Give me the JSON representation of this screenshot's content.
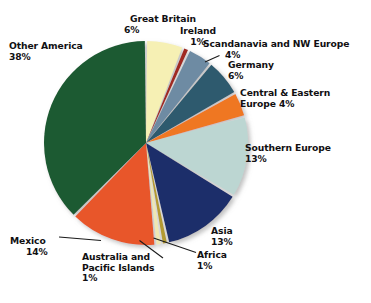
{
  "chart_data": {
    "type": "pie",
    "title": "",
    "subtitle": "",
    "xlabel": "",
    "ylabel": "",
    "legend_position": "none",
    "grid": false,
    "units": "percent",
    "start_angle_deg": 0,
    "direction": "clockwise",
    "background_color": "#ffffff",
    "label_color": "#111012",
    "categories": [
      "Great Britain",
      "Ireland",
      "Scandanavia and NW Europe",
      "Germany",
      "Central & Eastern Europe",
      "Southern Europe",
      "Asia",
      "Africa",
      "Australia and Pacific Islands",
      "Mexico",
      "Other America"
    ],
    "values": [
      6,
      1,
      4,
      6,
      4,
      13,
      13,
      1,
      1,
      14,
      38
    ],
    "colors": [
      "#f6f0b4",
      "#a02a22",
      "#6e8ba3",
      "#2d5a6e",
      "#ef7723",
      "#bcd6d2",
      "#1b2d6b",
      "#b39a33",
      "#efe7b2",
      "#e8562a",
      "#1a5a31"
    ],
    "slices": [
      {
        "name": "Great Britain",
        "value": 6,
        "value_text": "6%",
        "label_lines": [
          "Great Britain",
          "6%"
        ],
        "color": "#f6f0b4",
        "leader_line": false
      },
      {
        "name": "Ireland",
        "value": 1,
        "value_text": "1%",
        "label_lines": [
          "Ireland",
          "1%"
        ],
        "color": "#a02a22",
        "leader_line": false
      },
      {
        "name": "Scandanavia and NW Europe",
        "value": 4,
        "value_text": "4%",
        "label_lines": [
          "Scandanavia and NW Europe",
          "4%"
        ],
        "color": "#6e8ba3",
        "leader_line": true
      },
      {
        "name": "Germany",
        "value": 6,
        "value_text": "6%",
        "label_lines": [
          "Germany",
          "6%"
        ],
        "color": "#2d5a6e",
        "leader_line": false
      },
      {
        "name": "Central & Eastern Europe",
        "value": 4,
        "value_text": "4%",
        "label_lines": [
          "Central & Eastern",
          "Europe  4%"
        ],
        "color": "#ef7723",
        "leader_line": false
      },
      {
        "name": "Southern Europe",
        "value": 13,
        "value_text": "13%",
        "label_lines": [
          "Southern Europe",
          "13%"
        ],
        "color": "#bcd6d2",
        "leader_line": false
      },
      {
        "name": "Asia",
        "value": 13,
        "value_text": "13%",
        "label_lines": [
          "Asia",
          "13%"
        ],
        "color": "#1b2d6b",
        "leader_line": false
      },
      {
        "name": "Africa",
        "value": 1,
        "value_text": "1%",
        "label_lines": [
          "Africa",
          "1%"
        ],
        "color": "#b39a33",
        "leader_line": true
      },
      {
        "name": "Australia and Pacific Islands",
        "value": 1,
        "value_text": "1%",
        "label_lines": [
          "Australia and",
          "Pacific Islands",
          "1%"
        ],
        "color": "#efe7b2",
        "leader_line": true
      },
      {
        "name": "Mexico",
        "value": 14,
        "value_text": "14%",
        "label_lines": [
          "Mexico",
          "14%"
        ],
        "color": "#e8562a",
        "leader_line": true
      },
      {
        "name": "Other America",
        "value": 38,
        "value_text": "38%",
        "label_lines": [
          "Other America",
          "38%"
        ],
        "color": "#1a5a31",
        "leader_line": false
      }
    ]
  },
  "labels": {
    "great_britain": {
      "name": "Great Britain",
      "pct": "6%"
    },
    "ireland": {
      "name": "Ireland",
      "pct": "1%"
    },
    "scandinavia": {
      "name": "Scandanavia and NW Europe",
      "pct": "4%"
    },
    "germany": {
      "name": "Germany",
      "pct": "6%"
    },
    "central_eastern": {
      "name": "Central & Eastern",
      "pct": "Europe  4%"
    },
    "southern_europe": {
      "name": "Southern Europe",
      "pct": "13%"
    },
    "asia": {
      "name": "Asia",
      "pct": "13%"
    },
    "africa": {
      "name": "Africa",
      "pct": "1%"
    },
    "australia_line1": {
      "name": "Australia and",
      "line2": "Pacific Islands",
      "pct": "1%"
    },
    "mexico": {
      "name": "Mexico",
      "pct": "14%"
    },
    "other_america": {
      "name": "Other America",
      "pct": "38%"
    }
  }
}
